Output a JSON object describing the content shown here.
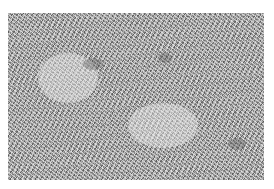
{
  "image": {
    "subject": "grayscale grass texture",
    "alt": "Close-up grayscale photograph of dense grass blades"
  },
  "colors": {
    "background": "#ffffff",
    "texture_mid": "#a9a9a9",
    "texture_light": "#ebebeb",
    "texture_dark": "#3c3c3c"
  }
}
